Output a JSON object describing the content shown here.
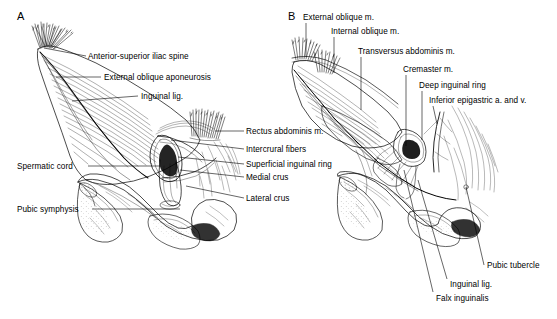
{
  "figure": {
    "background_color": "#ffffff",
    "ink_color": "#000000",
    "panels": [
      {
        "letter": "A",
        "letter_x": 17,
        "letter_y": 10,
        "description": "Superficial dissection of the inguinal region showing external oblique aponeurosis and superficial inguinal ring"
      },
      {
        "letter": "B",
        "letter_x": 288,
        "letter_y": 10,
        "description": "Deeper dissection of the inguinal region showing internal oblique, transversus abdominis and deep inguinal ring"
      }
    ]
  },
  "labels_panel_a": [
    {
      "id": "anterior-superior-iliac-spine",
      "text": "Anterior-superior iliac spine",
      "x": 88,
      "y": 53,
      "align": "left",
      "leader": {
        "x1": 86,
        "y1": 56,
        "x2": 44,
        "y2": 48
      }
    },
    {
      "id": "external-oblique-aponeurosis",
      "text": "External oblique aponeurosis",
      "x": 104,
      "y": 74,
      "align": "left",
      "leader": {
        "x1": 101,
        "y1": 77,
        "x2": 56,
        "y2": 77
      }
    },
    {
      "id": "inguinal-lig",
      "text": "Inguinal lig.",
      "x": 141,
      "y": 93,
      "align": "left",
      "leader": {
        "x1": 138,
        "y1": 96,
        "x2": 72,
        "y2": 101
      }
    },
    {
      "id": "rectus-abdominis-m",
      "text": "Rectus abdominis m.",
      "x": 246,
      "y": 128,
      "align": "left",
      "leader": {
        "x1": 244,
        "y1": 131,
        "x2": 215,
        "y2": 131
      }
    },
    {
      "id": "intercrural-fibers",
      "text": "Intercrural fibers",
      "x": 246,
      "y": 146,
      "align": "left",
      "leader": {
        "x1": 244,
        "y1": 149,
        "x2": 171,
        "y2": 140
      }
    },
    {
      "id": "superficial-inguinal-ring",
      "text": "Superficial inguinal ring",
      "x": 246,
      "y": 161,
      "align": "left",
      "leader": {
        "x1": 244,
        "y1": 164,
        "x2": 178,
        "y2": 157
      }
    },
    {
      "id": "medial-crus",
      "text": "Medial crus",
      "x": 246,
      "y": 174,
      "align": "left",
      "leader": {
        "x1": 244,
        "y1": 177,
        "x2": 180,
        "y2": 170
      }
    },
    {
      "id": "lateral-crus",
      "text": "Lateral crus",
      "x": 246,
      "y": 195,
      "align": "left",
      "leader": {
        "x1": 244,
        "y1": 198,
        "x2": 186,
        "y2": 186
      }
    },
    {
      "id": "spermatic-cord",
      "text": "Spermatic cord",
      "x": 17,
      "y": 163,
      "align": "left",
      "leader": {
        "x1": 88,
        "y1": 166,
        "x2": 160,
        "y2": 166
      }
    },
    {
      "id": "pubic-symphysis",
      "text": "Pubic symphysis",
      "x": 17,
      "y": 206,
      "align": "left",
      "leader": {
        "x1": 92,
        "y1": 209,
        "x2": 180,
        "y2": 209
      }
    }
  ],
  "labels_panel_b": [
    {
      "id": "external-oblique-m",
      "text": "External oblique m.",
      "x": 303,
      "y": 14,
      "align": "left",
      "leader": {
        "x1": 306,
        "y1": 23,
        "x2": 306,
        "y2": 57
      }
    },
    {
      "id": "internal-oblique-m",
      "text": "Internal oblique m.",
      "x": 331,
      "y": 28,
      "align": "left",
      "leader": {
        "x1": 334,
        "y1": 37,
        "x2": 334,
        "y2": 73
      }
    },
    {
      "id": "transversus-abdominis-m",
      "text": "Transversus abdominis m.",
      "x": 358,
      "y": 48,
      "align": "left",
      "leader": {
        "x1": 361,
        "y1": 57,
        "x2": 361,
        "y2": 110
      }
    },
    {
      "id": "cremaster-m",
      "text": "Cremaster m.",
      "x": 403,
      "y": 66,
      "align": "left",
      "leader": {
        "x1": 406,
        "y1": 75,
        "x2": 406,
        "y2": 146
      }
    },
    {
      "id": "deep-inguinal-ring",
      "text": "Deep inguinal ring",
      "x": 419,
      "y": 82,
      "align": "left",
      "leader": {
        "x1": 422,
        "y1": 91,
        "x2": 422,
        "y2": 140
      }
    },
    {
      "id": "inferior-epigastric-a-and-v",
      "text": "Inferior epigastric a. and v.",
      "x": 429,
      "y": 97,
      "align": "left",
      "leader": {
        "x1": 433,
        "y1": 106,
        "x2": 437,
        "y2": 124
      }
    },
    {
      "id": "pubic-tubercle",
      "text": "Pubic tubercle",
      "x": 487,
      "y": 262,
      "align": "left",
      "leader": {
        "x1": 484,
        "y1": 265,
        "x2": 466,
        "y2": 187
      }
    },
    {
      "id": "inguinal-lig-b",
      "text": "Inguinal lig.",
      "x": 450,
      "y": 281,
      "align": "left",
      "leader": {
        "x1": 447,
        "y1": 279,
        "x2": 418,
        "y2": 180
      }
    },
    {
      "id": "falx-inguinalis",
      "text": "Falx inguinalis",
      "x": 436,
      "y": 295,
      "align": "left",
      "leader": {
        "x1": 433,
        "y1": 292,
        "x2": 404,
        "y2": 170
      }
    }
  ]
}
